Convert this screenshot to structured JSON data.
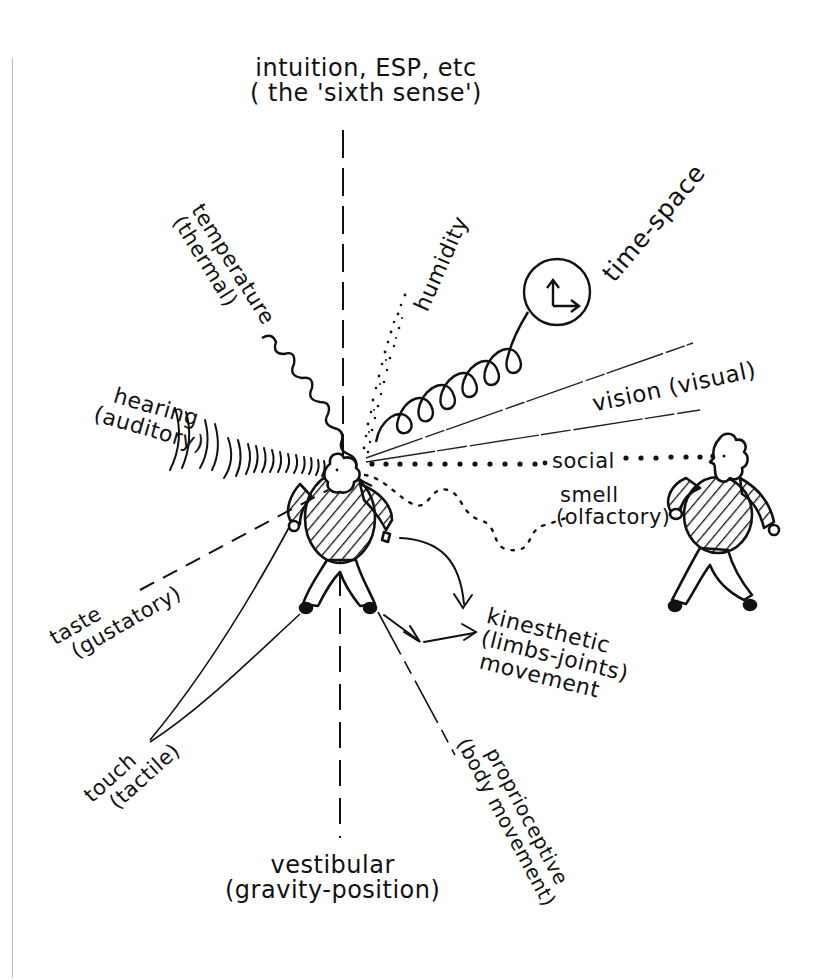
{
  "diagram": {
    "colors": {
      "ink": "#111111",
      "background": "#ffffff",
      "edge": "#bdbdbd"
    },
    "senses": [
      {
        "id": "intuition",
        "line1": "intuition, ESP, etc",
        "line2": "( the 'sixth sense')",
        "connector": "dashed-vertical-up"
      },
      {
        "id": "temperature",
        "line1": "temperature",
        "line2": "(thermal)",
        "connector": "wavy"
      },
      {
        "id": "humidity",
        "line1": "humidity",
        "line2": "",
        "connector": "stippled-dots"
      },
      {
        "id": "time-space",
        "line1": "time-space",
        "line2": "",
        "connector": "spiral-to-clock"
      },
      {
        "id": "vision",
        "line1": "vision (visual)",
        "line2": "",
        "connector": "two-fine-lines"
      },
      {
        "id": "social",
        "line1": "social",
        "line2": "",
        "connector": "dotted-to-other-person"
      },
      {
        "id": "smell",
        "line1": "smell",
        "line2": "(olfactory)",
        "connector": "dotted-wavy"
      },
      {
        "id": "hearing",
        "line1": "hearing",
        "line2": "(auditory)",
        "connector": "sound-waves"
      },
      {
        "id": "taste",
        "line1": "taste",
        "line2": "(gustatory)",
        "connector": "dashed"
      },
      {
        "id": "touch",
        "line1": "touch",
        "line2": "(tactile)",
        "connector": "two-lines-from-hand-foot"
      },
      {
        "id": "vestibular",
        "line1": "vestibular",
        "line2": "(gravity-position)",
        "connector": "dashed-vertical-down"
      },
      {
        "id": "proprioceptive",
        "line1": "proprioceptive",
        "line2": "(body movement)",
        "connector": "long-dashed"
      },
      {
        "id": "kinesthetic",
        "line1": "kinesthetic",
        "line2": "(limbs-joints)",
        "line3": "movement",
        "connector": "arrows"
      }
    ],
    "figures": [
      {
        "id": "central-person",
        "description": "person with striped sweater at center"
      },
      {
        "id": "other-person",
        "description": "second person with curly hair on right"
      }
    ]
  }
}
